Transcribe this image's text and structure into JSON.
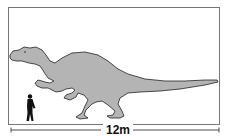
{
  "diagram": {
    "type": "size-comparison",
    "reference": "human-silhouette",
    "scale_label": "12m",
    "colors": {
      "dinosaur_fill": "#b4b4b4",
      "outline": "#222222",
      "human_fill": "#111111",
      "frame": "#777777",
      "background": "#ffffff"
    }
  }
}
